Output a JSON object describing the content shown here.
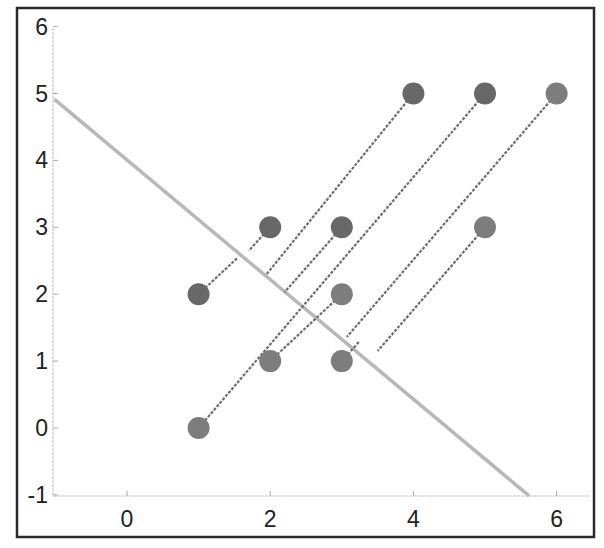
{
  "chart_data": {
    "type": "scatter",
    "title": "",
    "xlabel": "",
    "ylabel": "",
    "xlim": [
      -1,
      6.4
    ],
    "ylim": [
      -1,
      6
    ],
    "xticks": [
      0,
      2,
      4,
      6
    ],
    "yticks": [
      -1,
      0,
      1,
      2,
      3,
      4,
      5,
      6
    ],
    "grid": false,
    "legend": null,
    "series": [
      {
        "name": "points",
        "x": [
          1,
          2,
          1,
          2,
          3,
          3,
          3,
          4,
          5,
          5,
          6
        ],
        "y": [
          2,
          3,
          0,
          1,
          1,
          2,
          3,
          5,
          5,
          3,
          5
        ],
        "marker": "circle",
        "color": "#737373"
      }
    ],
    "separating_line": {
      "from": [
        -1,
        4.9
      ],
      "to": [
        5.6,
        -1
      ],
      "color": "#b8b8b8",
      "style": "solid"
    },
    "projection_segments": [
      {
        "from": [
          1,
          2
        ],
        "to": [
          1.55,
          2.55
        ]
      },
      {
        "from": [
          2,
          3
        ],
        "to": [
          1.7,
          2.65
        ]
      },
      {
        "from": [
          4,
          5
        ],
        "to": [
          1.95,
          2.3
        ]
      },
      {
        "from": [
          3,
          3
        ],
        "to": [
          2.2,
          2.03
        ]
      },
      {
        "from": [
          5,
          5
        ],
        "to": [
          1,
          0
        ]
      },
      {
        "from": [
          3,
          2
        ],
        "to": [
          2,
          1
        ]
      },
      {
        "from": [
          6,
          5
        ],
        "to": [
          3.07,
          1.36
        ]
      },
      {
        "from": [
          3,
          1
        ],
        "to": [
          3.25,
          1.3
        ]
      },
      {
        "from": [
          5,
          3
        ],
        "to": [
          3.5,
          1.15
        ]
      }
    ]
  },
  "axes": {
    "x_tick_labels": [
      "0",
      "2",
      "4",
      "6"
    ],
    "y_tick_labels": [
      "6",
      "5",
      "4",
      "3",
      "2",
      "1",
      "0",
      "-1"
    ]
  }
}
